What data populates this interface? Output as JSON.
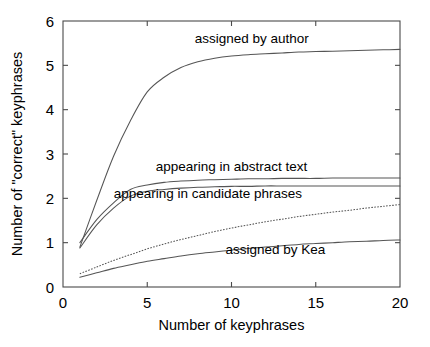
{
  "chart_data": {
    "type": "line",
    "title": "",
    "xlabel": "Number of keyphrases",
    "ylabel": "Number of \"correct\" keyphrases",
    "xlim": [
      0,
      20
    ],
    "ylim": [
      0,
      6
    ],
    "xticks": [
      0,
      5,
      10,
      15,
      20
    ],
    "yticks": [
      0,
      1,
      2,
      3,
      4,
      5,
      6
    ],
    "xtick_labels": [
      "0",
      "5",
      "10",
      "15",
      "20"
    ],
    "ytick_labels": [
      "0",
      "1",
      "2",
      "3",
      "4",
      "5",
      "6"
    ],
    "grid": false,
    "legend_position": "inline-annotations",
    "x": [
      1,
      2,
      3,
      4,
      5,
      6,
      7,
      8,
      9,
      10,
      11,
      12,
      13,
      14,
      15,
      16,
      17,
      18,
      19,
      20
    ],
    "series": [
      {
        "name": "assigned by author",
        "style": "solid",
        "color": "#555555",
        "label": "assigned by author",
        "label_x": 11.2,
        "label_y": 5.62,
        "values": [
          0.9,
          1.95,
          2.95,
          3.75,
          4.4,
          4.73,
          4.95,
          5.08,
          5.16,
          5.21,
          5.24,
          5.26,
          5.28,
          5.3,
          5.31,
          5.32,
          5.33,
          5.34,
          5.35,
          5.36
        ]
      },
      {
        "name": "appearing in abstract text",
        "style": "solid",
        "color": "#555555",
        "label": "appearing in abstract text",
        "label_x": 10.0,
        "label_y": 2.72,
        "values": [
          1.0,
          1.52,
          1.9,
          2.2,
          2.3,
          2.36,
          2.39,
          2.41,
          2.42,
          2.43,
          2.44,
          2.44,
          2.45,
          2.45,
          2.45,
          2.46,
          2.46,
          2.46,
          2.46,
          2.46
        ]
      },
      {
        "name": "appearing in candidate phrases",
        "style": "solid",
        "color": "#555555",
        "label": "appearing in candidate phrases",
        "label_x": 8.6,
        "label_y": 2.12,
        "values": [
          0.88,
          1.4,
          1.78,
          2.05,
          2.16,
          2.2,
          2.23,
          2.25,
          2.26,
          2.27,
          2.27,
          2.28,
          2.28,
          2.28,
          2.28,
          2.28,
          2.28,
          2.28,
          2.28,
          2.28
        ]
      },
      {
        "name": "assigned by Kea",
        "style": "dotted",
        "color": "#555555",
        "label": "",
        "label_x": null,
        "label_y": null,
        "values": [
          0.3,
          0.45,
          0.6,
          0.73,
          0.86,
          0.97,
          1.07,
          1.16,
          1.25,
          1.33,
          1.4,
          1.47,
          1.53,
          1.59,
          1.64,
          1.69,
          1.73,
          1.78,
          1.82,
          1.86
        ]
      },
      {
        "name": "assigned by Kea (solid)",
        "style": "solid",
        "color": "#555555",
        "label": "assigned by Kea",
        "label_x": 12.6,
        "label_y": 0.86,
        "values": [
          0.22,
          0.32,
          0.42,
          0.5,
          0.58,
          0.64,
          0.7,
          0.75,
          0.79,
          0.83,
          0.87,
          0.9,
          0.93,
          0.96,
          0.98,
          1.0,
          1.02,
          1.03,
          1.05,
          1.06
        ]
      }
    ]
  }
}
